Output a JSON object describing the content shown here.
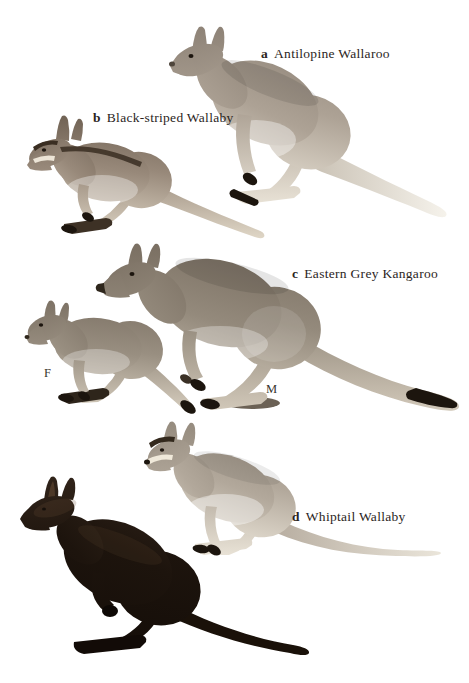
{
  "plate": {
    "background": "#ffffff",
    "ink": "#1c150e",
    "text_color": "#2b251d",
    "animals": [
      {
        "key": "a",
        "name": "Antilopine Wallaroo",
        "color_dark": "#8f8478",
        "color_mid": "#ada295",
        "color_light": "#ece6da",
        "tail_base": "#c9c1b4",
        "tail_tip": "#f6f3ec"
      },
      {
        "key": "b",
        "name": "Black-striped Wallaby",
        "color_dark": "#6e6052",
        "color_mid": "#98897a",
        "color_light": "#dfd6c6",
        "stripe_color": "#3a2e22",
        "face_stripe": "#ece4d6"
      },
      {
        "key": "c",
        "name": "Eastern Grey Kangaroo",
        "female_label": "F",
        "male_label": "M",
        "color_dark": "#7a6f62",
        "color_mid": "#948a7c",
        "color_light": "#d6cdbe",
        "female_color_dark": "#7d7265",
        "female_color_mid": "#998f81",
        "female_color_light": "#d9d0c1"
      },
      {
        "key": "d",
        "name": "Whiptail Wallaby",
        "color_dark": "#958b7e",
        "color_mid": "#b2a89b",
        "color_light": "#ece6da",
        "tail_base": "#b8aea1",
        "tail_tip": "#ebe6db",
        "face_stripe": "#f0e9da",
        "brow_color": "#33291d"
      }
    ],
    "dark_animal": {
      "color_dark": "#31241a",
      "color_mid": "#1d140d",
      "color_light": "#140d08",
      "sheen": "#6b4f38"
    }
  }
}
